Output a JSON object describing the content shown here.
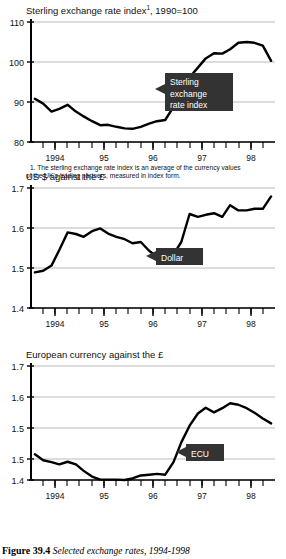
{
  "figure": {
    "caption_number": "Figure 39.4",
    "caption_text": "Selected exchange rates, 1994-1998"
  },
  "footnote": {
    "line1": "1. The sterling exchange rate index is an average of the currency values",
    "line2": "of the UK's trading partners, measured in index form."
  },
  "chart_data": [
    {
      "type": "line",
      "id": "sterling-index",
      "title": "Sterling exchange rate index",
      "title_superscript": "1",
      "title_suffix": ", 1990=100",
      "xlabel": "",
      "ylabel": "",
      "ylim": [
        80,
        110
      ],
      "yticks": [
        110,
        100,
        90,
        80
      ],
      "ytick_labels": [
        "110",
        "100",
        "90",
        "80"
      ],
      "xlim": [
        1993.5,
        1998.5
      ],
      "xticks": [
        1994,
        1995,
        1996,
        1997,
        1998
      ],
      "xtick_labels": [
        "1994",
        "95",
        "96",
        "97",
        "98"
      ],
      "grid": true,
      "annotation": "Sterling exchange rate index",
      "annotation_lines": [
        "Sterling",
        "exchange",
        "rate index"
      ],
      "x": [
        1993.58,
        1993.75,
        1993.92,
        1994.08,
        1994.25,
        1994.42,
        1994.58,
        1994.75,
        1994.92,
        1995.08,
        1995.25,
        1995.42,
        1995.58,
        1995.75,
        1995.92,
        1996.08,
        1996.25,
        1996.42,
        1996.58,
        1996.75,
        1996.92,
        1997.08,
        1997.25,
        1997.42,
        1997.58,
        1997.75,
        1997.92,
        1998.08,
        1998.25,
        1998.42
      ],
      "values": [
        90.8,
        89.6,
        87.6,
        88.3,
        89.3,
        87.6,
        86.4,
        85.2,
        84.2,
        84.3,
        83.8,
        83.4,
        83.3,
        83.8,
        84.6,
        85.2,
        85.5,
        88.8,
        92.8,
        96.2,
        98.6,
        100.9,
        102.2,
        102.1,
        103.2,
        104.8,
        105.0,
        104.8,
        104.1,
        100.3
      ]
    },
    {
      "type": "line",
      "id": "us-dollar",
      "title": "US $ against the £",
      "title_superscript": "",
      "title_suffix": "",
      "xlabel": "",
      "ylabel": "",
      "ylim": [
        1.4,
        1.7
      ],
      "yticks": [
        1.7,
        1.6,
        1.5,
        1.4
      ],
      "ytick_labels": [
        "1.7",
        "1.6",
        "1.5",
        "1.4"
      ],
      "xlim": [
        1993.5,
        1998.5
      ],
      "xticks": [
        1994,
        1995,
        1996,
        1997,
        1998
      ],
      "xtick_labels": [
        "1994",
        "95",
        "96",
        "97",
        "98"
      ],
      "grid": true,
      "annotation": "Dollar",
      "annotation_lines": [
        "Dollar"
      ],
      "x": [
        1993.58,
        1993.75,
        1993.92,
        1994.08,
        1994.25,
        1994.42,
        1994.58,
        1994.75,
        1994.92,
        1995.08,
        1995.25,
        1995.42,
        1995.58,
        1995.75,
        1995.92,
        1996.08,
        1996.25,
        1996.42,
        1996.58,
        1996.75,
        1996.92,
        1997.08,
        1997.25,
        1997.42,
        1997.58,
        1997.75,
        1997.92,
        1998.08,
        1998.25,
        1998.42
      ],
      "values": [
        1.489,
        1.493,
        1.506,
        1.545,
        1.589,
        1.585,
        1.578,
        1.592,
        1.599,
        1.586,
        1.578,
        1.572,
        1.562,
        1.565,
        1.543,
        1.528,
        1.522,
        1.534,
        1.565,
        1.635,
        1.628,
        1.633,
        1.637,
        1.628,
        1.657,
        1.644,
        1.644,
        1.648,
        1.648,
        1.679
      ]
    },
    {
      "type": "line",
      "id": "european-currency",
      "title": "European currency against the £",
      "title_superscript": "",
      "title_suffix": "",
      "xlabel": "",
      "ylabel": "",
      "ylim": [
        1.4,
        1.7
      ],
      "yticks": [
        1.7,
        1.6,
        1.5,
        1.45,
        1.4
      ],
      "ytick_labels": [
        "1.7",
        "1.6",
        "1.5",
        "1.5",
        "1.4"
      ],
      "xlim": [
        1993.5,
        1998.5
      ],
      "xticks": [
        1994,
        1995,
        1996,
        1997,
        1998
      ],
      "xtick_labels": [
        "1994",
        "95",
        "96",
        "97",
        "98"
      ],
      "grid": true,
      "annotation": "ECU",
      "annotation_lines": [
        "ECU"
      ],
      "x": [
        1993.58,
        1993.75,
        1993.92,
        1994.08,
        1994.25,
        1994.42,
        1994.58,
        1994.75,
        1994.92,
        1995.08,
        1995.25,
        1995.42,
        1995.58,
        1995.75,
        1995.92,
        1996.08,
        1996.25,
        1996.42,
        1996.58,
        1996.75,
        1996.92,
        1997.08,
        1997.25,
        1997.42,
        1997.58,
        1997.75,
        1997.92,
        1998.08,
        1998.25,
        1998.42
      ],
      "values": [
        1.468,
        1.452,
        1.447,
        1.441,
        1.448,
        1.441,
        1.424,
        1.409,
        1.401,
        1.401,
        1.401,
        1.4,
        1.404,
        1.412,
        1.414,
        1.416,
        1.414,
        1.447,
        1.499,
        1.543,
        1.575,
        1.59,
        1.578,
        1.589,
        1.602,
        1.598,
        1.589,
        1.577,
        1.562,
        1.549
      ]
    }
  ]
}
